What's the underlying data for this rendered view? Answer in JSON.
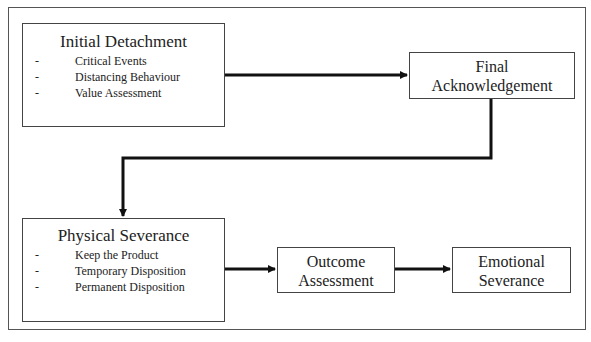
{
  "diagram": {
    "type": "flowchart",
    "nodes": [
      {
        "id": "initial_detachment",
        "title": "Initial Detachment",
        "items": [
          "Critical Events",
          "Distancing Behaviour",
          "Value Assessment"
        ]
      },
      {
        "id": "final_acknowledgement",
        "title_line1": "Final",
        "title_line2": "Acknowledgement"
      },
      {
        "id": "physical_severance",
        "title": "Physical Severance",
        "items": [
          "Keep the Product",
          "Temporary Disposition",
          "Permanent Disposition"
        ]
      },
      {
        "id": "outcome_assessment",
        "title_line1": "Outcome",
        "title_line2": "Assessment"
      },
      {
        "id": "emotional_severance",
        "title_line1": "Emotional",
        "title_line2": "Severance"
      }
    ],
    "edges": [
      {
        "from": "initial_detachment",
        "to": "final_acknowledgement"
      },
      {
        "from": "final_acknowledgement",
        "to": "physical_severance"
      },
      {
        "from": "physical_severance",
        "to": "outcome_assessment"
      },
      {
        "from": "outcome_assessment",
        "to": "emotional_severance"
      }
    ],
    "bullet": "-"
  }
}
